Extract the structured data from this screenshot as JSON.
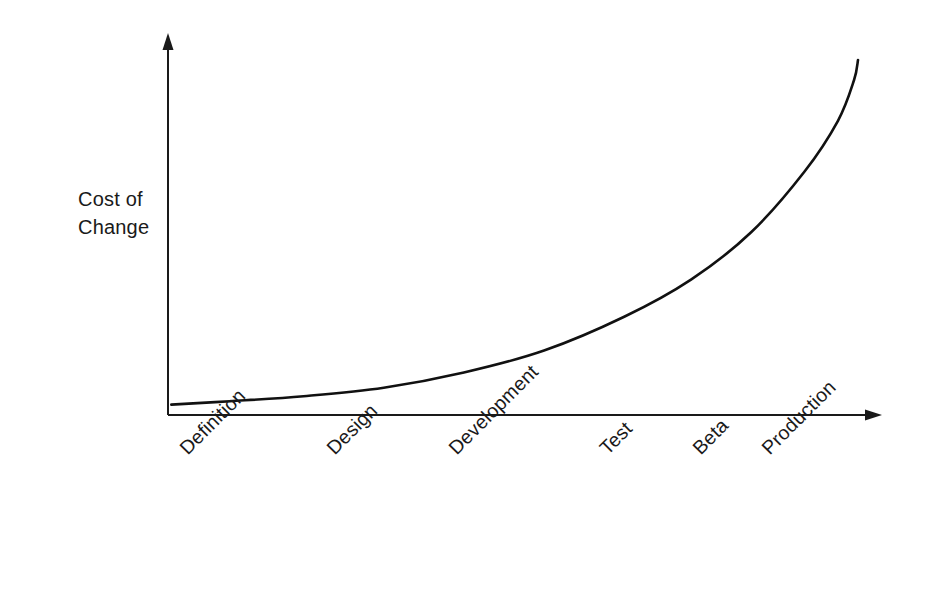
{
  "chart_data": {
    "type": "line",
    "title": "",
    "subtitle": "",
    "xlabel": "",
    "ylabel": "Cost of Change",
    "ylabel_lines": [
      "Cost of",
      "Change"
    ],
    "categories": [
      "Definition",
      "Design",
      "Development",
      "Test",
      "Beta",
      "Production"
    ],
    "series": [
      {
        "name": "Cost of Change",
        "values": [
          1,
          3,
          8,
          22,
          55,
          100
        ]
      }
    ],
    "x": [
      0,
      1,
      2,
      3,
      4,
      5
    ],
    "xlim": [
      0,
      5.6
    ],
    "ylim": [
      0,
      110
    ],
    "grid": false,
    "legend": false,
    "legend_position": "none",
    "axis_arrows": true,
    "tick_marks": false,
    "tick_label_rotation": -45,
    "annotations": [],
    "curve_points": [
      {
        "x": 0.01,
        "y": 1.0
      },
      {
        "x": 0.45,
        "y": 2.0
      },
      {
        "x": 1.0,
        "y": 3.5
      },
      {
        "x": 1.6,
        "y": 6.0
      },
      {
        "x": 2.2,
        "y": 10.5
      },
      {
        "x": 2.8,
        "y": 17.0
      },
      {
        "x": 3.4,
        "y": 27.0
      },
      {
        "x": 3.9,
        "y": 38.0
      },
      {
        "x": 4.35,
        "y": 52.0
      },
      {
        "x": 4.75,
        "y": 70.0
      },
      {
        "x": 5.0,
        "y": 85.0
      },
      {
        "x": 5.12,
        "y": 97.0
      },
      {
        "x": 5.15,
        "y": 103.0
      }
    ]
  },
  "colors": {
    "background": "#ffffff",
    "axis": "#1a1a1a",
    "curve": "#111111",
    "text": "#1a1a1a"
  },
  "axes": {
    "y_axis_name": "vertical-cost-axis",
    "x_axis_name": "horizontal-phase-axis"
  }
}
